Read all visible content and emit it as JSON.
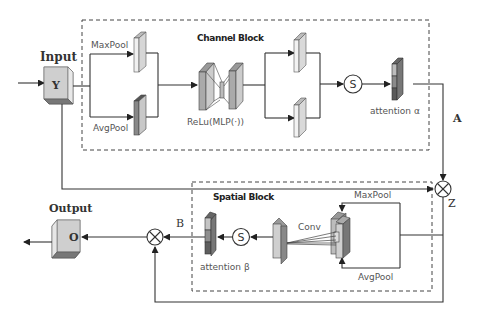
{
  "diagram": {
    "type": "attention-module-flowchart",
    "input": {
      "title": "Input",
      "symbol": "Y"
    },
    "output": {
      "title": "Output",
      "symbol": "O"
    },
    "channel_block": {
      "title": "Channel Block",
      "branches": [
        "MaxPool",
        "AvgPool"
      ],
      "mlp_label": "ReLu(MLP(·))",
      "sigmoid_symbol": "S",
      "attention_label": "attention α"
    },
    "spatial_block": {
      "title": "Spatial Block",
      "branches": [
        "MaxPool",
        "AvgPool"
      ],
      "conv_label": "Conv",
      "sigmoid_symbol": "S",
      "attention_label": "attention β"
    },
    "edge_labels": {
      "A": "A",
      "B": "B",
      "Z": "Z"
    },
    "operators": {
      "multiply_1": "⊗",
      "multiply_2": "⊗"
    },
    "colors": {
      "line": "#333333",
      "block_light": "#e4e4e4",
      "block_mid": "#b8b8b8",
      "block_dark": "#6e6e6e",
      "box_face": "#cfcfcf"
    }
  }
}
